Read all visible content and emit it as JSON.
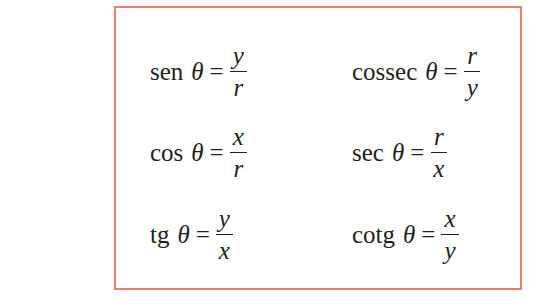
{
  "box": {
    "border_color": "#e8806a"
  },
  "formulas": [
    {
      "fn": "sen",
      "var": "θ",
      "eq": "=",
      "num": "y",
      "den": "r"
    },
    {
      "fn": "cossec",
      "var": "θ",
      "eq": "=",
      "num": "r",
      "den": "y"
    },
    {
      "fn": "cos",
      "var": "θ",
      "eq": "=",
      "num": "x",
      "den": "r"
    },
    {
      "fn": "sec",
      "var": "θ",
      "eq": "=",
      "num": "r",
      "den": "x"
    },
    {
      "fn": "tg",
      "var": "θ",
      "eq": "=",
      "num": "y",
      "den": "x"
    },
    {
      "fn": "cotg",
      "var": "θ",
      "eq": "=",
      "num": "x",
      "den": "y"
    }
  ]
}
